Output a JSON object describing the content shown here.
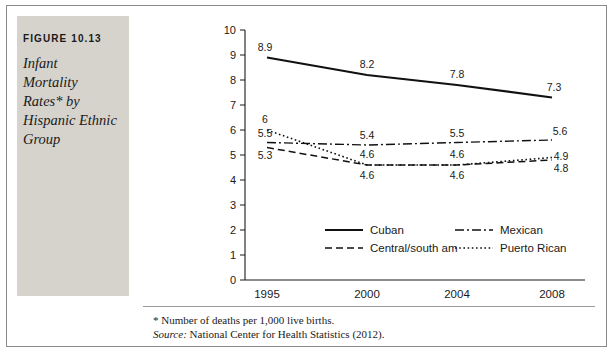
{
  "figure": {
    "number": "FIGURE 10.13",
    "title": "Infant Mortality Rates* by Hispanic Ethnic Group",
    "title_lines": [
      "Infant",
      "Mortality",
      "Rates* by",
      "Hispanic Ethnic",
      "Group"
    ],
    "footnote": "*  Number of deaths per 1,000 live births.",
    "source_label": "Source:",
    "source_text": " National Center for Health Statistics (2012)."
  },
  "chart_data": {
    "type": "line",
    "title": "",
    "xlabel": "",
    "ylabel": "",
    "categories": [
      "1995",
      "2000",
      "2004",
      "2008"
    ],
    "x_tick_labels": [
      "1995",
      "2000",
      "2004",
      "2008"
    ],
    "y_tick_labels": [
      "0",
      "1",
      "2",
      "3",
      "4",
      "5",
      "6",
      "7",
      "8",
      "9",
      "10"
    ],
    "ylim": [
      0,
      10
    ],
    "y_step": 1,
    "grid": false,
    "legend_position": "inside-bottom",
    "series": [
      {
        "name": "Cuban",
        "style": "solid",
        "values": [
          8.9,
          8.2,
          7.8,
          7.3
        ],
        "labels": [
          "8.9",
          "8.2",
          "7.8",
          "7.3"
        ]
      },
      {
        "name": "Mexican",
        "style": "dash-dot",
        "values": [
          5.5,
          5.4,
          5.5,
          5.6
        ],
        "labels": [
          "5.5",
          "5.4",
          "5.5",
          "5.6"
        ]
      },
      {
        "name": "Central/south am",
        "style": "dashed",
        "values": [
          5.3,
          4.6,
          4.6,
          4.8
        ],
        "labels": [
          "5.3",
          "4.6",
          "4.6",
          "4.8"
        ]
      },
      {
        "name": "Puerto Rican",
        "style": "dotted",
        "values": [
          6.0,
          4.6,
          4.6,
          4.9
        ],
        "labels": [
          "6",
          "4.6",
          "4.6",
          "4.9"
        ]
      }
    ]
  },
  "legend": [
    {
      "label": "Cuban",
      "style": "solid"
    },
    {
      "label": "Mexican",
      "style": "dash-dot"
    },
    {
      "label": "Central/south am",
      "style": "dashed"
    },
    {
      "label": "Puerto Rican",
      "style": "dotted"
    }
  ],
  "colors": {
    "panel": "#d6d3cd",
    "ink": "#1a1a1a",
    "frame": "#8a8a8a"
  }
}
